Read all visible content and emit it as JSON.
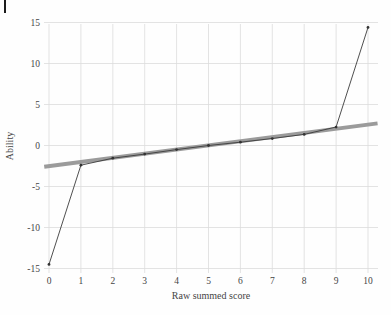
{
  "page": {
    "background": "#fefefe",
    "margin_mark_color": "#1c1c1c"
  },
  "chart_data": {
    "type": "line",
    "title": "",
    "xlabel": "Raw summed score",
    "ylabel": "Ability",
    "xlim": [
      0,
      10
    ],
    "ylim": [
      -15,
      15
    ],
    "x_ticks": [
      0,
      1,
      2,
      3,
      4,
      5,
      6,
      7,
      8,
      9,
      10
    ],
    "y_ticks": [
      15,
      10,
      5,
      0,
      -5,
      -10,
      -15
    ],
    "grid": true,
    "legend": "none",
    "colors": {
      "grid": "#dcdcdc",
      "linear_line": "#9b9b9b",
      "ml_line": "#3b3b3b",
      "marker": "#333333",
      "text": "#454545"
    },
    "series": [
      {
        "name": "linear-approximation",
        "style": "thick-line",
        "color": "#9b9b9b",
        "stroke_width": 4,
        "x": [
          -0.15,
          10.3
        ],
        "values": [
          -2.6,
          2.7
        ]
      },
      {
        "name": "ml-ability-estimates",
        "style": "line-with-markers",
        "color": "#3b3b3b",
        "stroke_width": 0.9,
        "x": [
          0,
          1,
          2,
          3,
          4,
          5,
          6,
          7,
          8,
          9,
          10
        ],
        "values": [
          -14.5,
          -2.4,
          -1.55,
          -1.05,
          -0.5,
          0.0,
          0.4,
          0.85,
          1.35,
          2.25,
          14.4
        ]
      }
    ]
  }
}
